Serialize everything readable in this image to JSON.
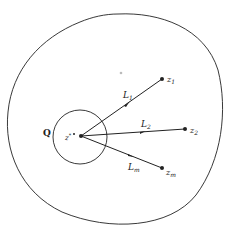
{
  "diagram": {
    "type": "geometric-figure",
    "region_label": "Q",
    "center_point": {
      "label": "z*",
      "base": "z",
      "sup": "*"
    },
    "points": [
      {
        "id": "z1",
        "base": "z",
        "sub": "1"
      },
      {
        "id": "z2",
        "base": "z",
        "sub": "2"
      },
      {
        "id": "zm",
        "base": "z",
        "sub": "m"
      }
    ],
    "segments": [
      {
        "id": "L1",
        "base": "L",
        "sub": "1",
        "from": "z*",
        "to": "z1"
      },
      {
        "id": "L2",
        "base": "L",
        "sub": "2",
        "from": "z*",
        "to": "z2"
      },
      {
        "id": "Lm",
        "base": "L",
        "sub": "m",
        "from": "z*",
        "to": "zm"
      }
    ],
    "colors": {
      "stroke": "#222222",
      "background": "#ffffff",
      "faint_dot": "#bbbbbb"
    }
  }
}
